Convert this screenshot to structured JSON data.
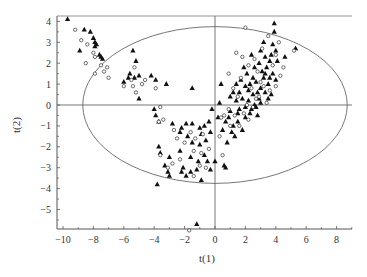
{
  "chart_data": {
    "type": "scatter",
    "title": "",
    "xlabel": "t(1)",
    "ylabel": "t(2)",
    "xlim": [
      -10.4,
      9.1
    ],
    "ylim": [
      -5.9,
      4.4
    ],
    "xticks": [
      -10,
      -8,
      -6,
      -4,
      -2,
      0,
      2,
      4,
      6,
      8
    ],
    "yticks": [
      -5,
      -4,
      -3,
      -2,
      -1,
      0,
      1,
      2,
      3,
      4
    ],
    "grid": false,
    "reference_lines": {
      "x": 0,
      "y": 0
    },
    "ellipse": {
      "cx": 0,
      "cy": 0,
      "rx": 8.7,
      "ry": 3.75,
      "label": "Hotelling T2 confidence ellipse"
    },
    "legend": null,
    "series": [
      {
        "name": "triangles",
        "marker": "filled-triangle",
        "color": "#111111",
        "points": [
          [
            -9.7,
            4.1
          ],
          [
            -8.6,
            3.6
          ],
          [
            -8.2,
            3.5
          ],
          [
            -8.0,
            3.2
          ],
          [
            -7.9,
            3.0
          ],
          [
            -7.8,
            2.9
          ],
          [
            -7.9,
            2.8
          ],
          [
            -7.6,
            2.4
          ],
          [
            -7.4,
            2.2
          ],
          [
            -8.9,
            2.6
          ],
          [
            -7.5,
            2.3
          ],
          [
            -5.4,
            2.6
          ],
          [
            -5.2,
            2.1
          ],
          [
            -5.6,
            1.5
          ],
          [
            -3.2,
            1.0
          ],
          [
            -6.0,
            1.1
          ],
          [
            -5.7,
            1.3
          ],
          [
            -5.3,
            1.3
          ],
          [
            -5.0,
            1.4
          ],
          [
            -4.2,
            1.4
          ],
          [
            -3.9,
            1.2
          ],
          [
            -1.5,
            0.8
          ],
          [
            -5.0,
            0.3
          ],
          [
            -4.0,
            -0.2
          ],
          [
            -3.9,
            -0.5
          ],
          [
            -3.7,
            -0.8
          ],
          [
            -2.8,
            -0.9
          ],
          [
            -2.3,
            -1.3
          ],
          [
            -1.9,
            -0.9
          ],
          [
            -1.5,
            -0.9
          ],
          [
            -1.0,
            -1.1
          ],
          [
            -0.7,
            -1.0
          ],
          [
            -0.3,
            -1.3
          ],
          [
            -2.2,
            -1.1
          ],
          [
            -1.8,
            -1.5
          ],
          [
            -1.5,
            -1.8
          ],
          [
            -1.0,
            -1.9
          ],
          [
            -0.6,
            -1.7
          ],
          [
            -3.7,
            -2.0
          ],
          [
            -3.6,
            -2.3
          ],
          [
            -3.0,
            -2.5
          ],
          [
            -2.3,
            -2.2
          ],
          [
            -1.6,
            -2.5
          ],
          [
            -1.1,
            -2.7
          ],
          [
            -0.7,
            -2.4
          ],
          [
            -0.5,
            -2.7
          ],
          [
            -1.2,
            -3.1
          ],
          [
            -2.2,
            -3.2
          ],
          [
            -3.3,
            -2.9
          ],
          [
            -3.0,
            -3.4
          ],
          [
            -0.9,
            -3.6
          ],
          [
            -2.1,
            -3.0
          ],
          [
            -3.1,
            -3.2
          ],
          [
            -1.9,
            -3.4
          ],
          [
            -1.6,
            -3.2
          ],
          [
            -3.8,
            -3.8
          ],
          [
            -1.2,
            -5.7
          ],
          [
            0.0,
            -2.7
          ],
          [
            -0.3,
            -3.1
          ],
          [
            0.7,
            -3.0
          ],
          [
            0.6,
            -2.9
          ],
          [
            -0.9,
            -1.4
          ],
          [
            -0.4,
            -0.8
          ],
          [
            0.2,
            -0.6
          ],
          [
            0.5,
            -1.2
          ],
          [
            0.7,
            -0.8
          ],
          [
            1.0,
            -0.3
          ],
          [
            1.2,
            -1.0
          ],
          [
            1.5,
            -0.8
          ],
          [
            1.3,
            -1.5
          ],
          [
            0.8,
            -1.8
          ],
          [
            1.8,
            -1.2
          ],
          [
            1.0,
            0.4
          ],
          [
            1.4,
            0.2
          ],
          [
            1.6,
            0.6
          ],
          [
            1.8,
            0.3
          ],
          [
            2.0,
            0.9
          ],
          [
            2.2,
            0.2
          ],
          [
            2.3,
            -0.4
          ],
          [
            2.5,
            0.5
          ],
          [
            2.7,
            1.1
          ],
          [
            2.9,
            0.3
          ],
          [
            3.0,
            0.8
          ],
          [
            3.2,
            1.3
          ],
          [
            1.6,
            -0.2
          ],
          [
            2.0,
            -0.6
          ],
          [
            2.4,
            -0.2
          ],
          [
            2.6,
            0.0
          ],
          [
            2.8,
            -0.5
          ],
          [
            3.0,
            0.1
          ],
          [
            3.3,
            0.6
          ],
          [
            3.5,
            1.0
          ],
          [
            3.7,
            0.5
          ],
          [
            1.7,
            1.2
          ],
          [
            2.1,
            1.5
          ],
          [
            2.6,
            1.8
          ],
          [
            2.9,
            2.0
          ],
          [
            3.1,
            1.6
          ],
          [
            3.4,
            1.8
          ],
          [
            3.6,
            2.1
          ],
          [
            3.8,
            1.5
          ],
          [
            2.4,
            2.4
          ],
          [
            3.0,
            2.6
          ],
          [
            3.3,
            2.3
          ],
          [
            3.8,
            2.9
          ],
          [
            3.9,
            3.5
          ],
          [
            4.0,
            2.6
          ],
          [
            3.2,
            3.0
          ],
          [
            4.1,
            2.1
          ],
          [
            2.2,
            0.7
          ],
          [
            1.9,
            1.8
          ],
          [
            1.4,
            1.0
          ],
          [
            1.2,
            0.6
          ],
          [
            2.3,
            1.0
          ],
          [
            2.7,
            -0.1
          ],
          [
            3.5,
            0.3
          ],
          [
            3.6,
            1.3
          ],
          [
            4.0,
            1.2
          ],
          [
            2.5,
            1.3
          ],
          [
            3.9,
            3.9
          ],
          [
            5.3,
            2.7
          ],
          [
            4.6,
            2.3
          ],
          [
            0.4,
            1.0
          ],
          [
            -0.2,
            -0.2
          ],
          [
            0.3,
            0.1
          ],
          [
            0.9,
            -0.6
          ],
          [
            1.1,
            -1.3
          ],
          [
            1.5,
            -0.4
          ],
          [
            2.0,
            -0.1
          ],
          [
            2.8,
            0.6
          ],
          [
            3.3,
            1.5
          ],
          [
            3.7,
            2.4
          ]
        ]
      },
      {
        "name": "circles",
        "marker": "open-circle",
        "color": "#111111",
        "points": [
          [
            -9.2,
            3.6
          ],
          [
            -8.8,
            3.1
          ],
          [
            -8.4,
            2.9
          ],
          [
            -8.0,
            2.5
          ],
          [
            -7.9,
            2.3
          ],
          [
            -8.5,
            2.0
          ],
          [
            -7.5,
            1.9
          ],
          [
            -7.3,
            1.6
          ],
          [
            -7.1,
            1.8
          ],
          [
            -7.9,
            1.5
          ],
          [
            -7.0,
            1.3
          ],
          [
            -5.3,
            1.8
          ],
          [
            -5.5,
            1.2
          ],
          [
            -5.4,
            0.9
          ],
          [
            -5.2,
            0.6
          ],
          [
            -4.8,
            1.0
          ],
          [
            -3.9,
            0.8
          ],
          [
            -6.0,
            0.9
          ],
          [
            -4.6,
            1.2
          ],
          [
            -3.6,
            -0.1
          ],
          [
            -3.7,
            -0.8
          ],
          [
            -3.4,
            -0.7
          ],
          [
            -2.7,
            -1.2
          ],
          [
            -2.5,
            -1.6
          ],
          [
            -1.6,
            -1.3
          ],
          [
            -1.3,
            -1.6
          ],
          [
            -0.8,
            -1.4
          ],
          [
            -2.0,
            -1.8
          ],
          [
            -1.4,
            -2.2
          ],
          [
            -0.9,
            -2.3
          ],
          [
            -0.4,
            -2.1
          ],
          [
            -3.6,
            -2.4
          ],
          [
            -2.8,
            -2.8
          ],
          [
            -2.3,
            -2.6
          ],
          [
            -1.4,
            -3.4
          ],
          [
            -1.0,
            -2.9
          ],
          [
            -0.6,
            -3.0
          ],
          [
            -3.1,
            -3.0
          ],
          [
            -1.7,
            -6.0
          ],
          [
            0.5,
            -2.4
          ],
          [
            0.3,
            -1.5
          ],
          [
            0.6,
            -0.5
          ],
          [
            0.9,
            -0.2
          ],
          [
            1.3,
            -0.5
          ],
          [
            1.6,
            -1.0
          ],
          [
            1.9,
            -0.4
          ],
          [
            2.2,
            -0.7
          ],
          [
            2.5,
            -0.1
          ],
          [
            2.9,
            0.4
          ],
          [
            3.2,
            0.9
          ],
          [
            3.6,
            0.7
          ],
          [
            4.0,
            0.9
          ],
          [
            4.3,
            1.4
          ],
          [
            1.2,
            0.8
          ],
          [
            1.7,
            1.3
          ],
          [
            2.2,
            1.9
          ],
          [
            2.6,
            2.2
          ],
          [
            3.1,
            2.7
          ],
          [
            4.0,
            2.4
          ],
          [
            4.2,
            3.0
          ],
          [
            1.4,
            2.5
          ],
          [
            0.9,
            1.5
          ],
          [
            1.8,
            2.3
          ],
          [
            3.5,
            3.3
          ],
          [
            2.0,
            3.7
          ],
          [
            5.2,
            2.6
          ],
          [
            4.5,
            1.8
          ],
          [
            3.0,
            1.1
          ],
          [
            2.4,
            0.8
          ],
          [
            1.5,
            0.4
          ],
          [
            2.1,
            0.0
          ],
          [
            2.7,
            0.3
          ],
          [
            3.4,
            0.1
          ],
          [
            1.0,
            -1.0
          ],
          [
            0.4,
            -0.6
          ],
          [
            3.8,
            1.9
          ],
          [
            2.8,
            1.6
          ]
        ]
      }
    ]
  },
  "axes": {
    "x_label": "t(1)",
    "y_label": "t(2)"
  }
}
